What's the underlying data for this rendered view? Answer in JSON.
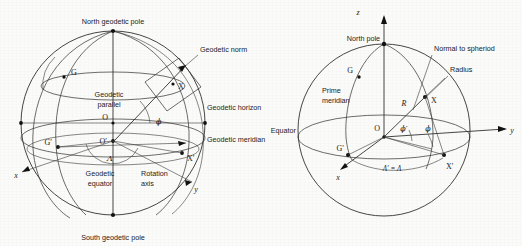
{
  "figure": {
    "background_color": "#fbfbfa",
    "ink_color": "#262626",
    "panel_count": 2
  },
  "left_panel": {
    "name": "geodetic-sphere",
    "labels": {
      "north_pole": "North geodetic pole",
      "south_pole": "South geodetic pole",
      "geodetic_normal": "Geodetic norm",
      "geodetic_horizon": "Geodetic horizon",
      "geodetic_meridian": "Geodetic meridian",
      "geodetic_parallel_line1": "Geodetic",
      "geodetic_parallel_line2": "parallel",
      "geodetic_equator_line1": "Geodetic",
      "geodetic_equator_line2": "equator",
      "rotation_axis_line1": "Rotation",
      "rotation_axis_line2": "axis"
    },
    "points": {
      "center": "O",
      "subcenter": "O′",
      "greenwich": "G",
      "greenwich_prime": "G′",
      "station": "X",
      "station_prime": "X′"
    },
    "axes": {
      "x": "x",
      "y": "y"
    },
    "angles": {
      "latitude": "ϕ",
      "longitude": "Λ"
    }
  },
  "right_panel": {
    "name": "geocentric-sphere",
    "labels": {
      "north_pole": "North pole",
      "normal_to_spheroid": "Normal to spheriod",
      "radius": "Radius",
      "prime_meridian_line1": "Prime",
      "prime_meridian_line2": "meridian",
      "equator": "Equator"
    },
    "points": {
      "center": "O",
      "greenwich": "G",
      "greenwich_prime": "G′",
      "station": "X",
      "station_prime": "X′"
    },
    "axes": {
      "x": "x",
      "y": "y",
      "z": "z"
    },
    "symbols": {
      "radius_symbol": "R",
      "geocentric_latitude": "ϕ′",
      "geodetic_latitude": "ϕ",
      "longitude_equality": "Λ′ = Λ"
    }
  }
}
